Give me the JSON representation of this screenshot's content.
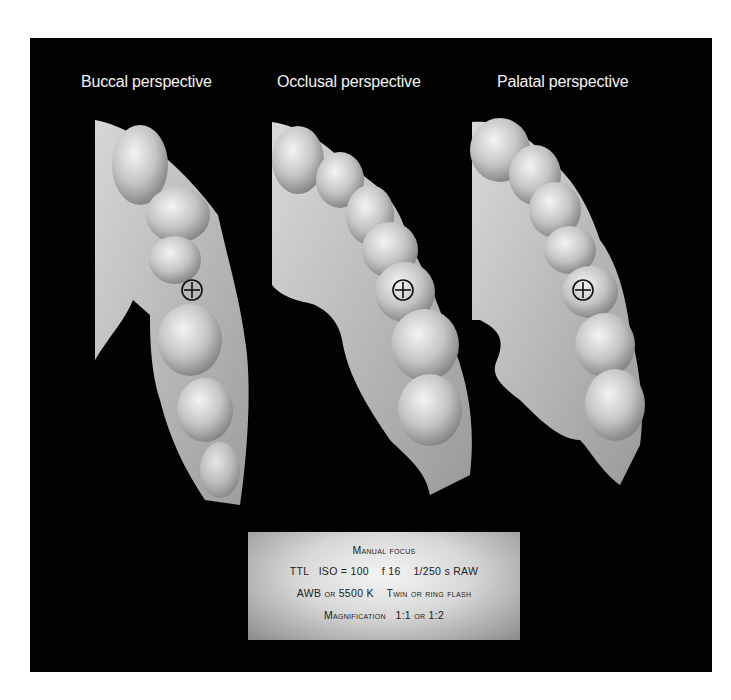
{
  "panel": {
    "background": "#020202"
  },
  "views": [
    {
      "id": "buccal",
      "caption": "Buccal perspective",
      "marker": {
        "cx": 192,
        "cy": 290,
        "r": 10
      }
    },
    {
      "id": "occlusal",
      "caption": "Occlusal perspective",
      "marker": {
        "cx": 403,
        "cy": 290,
        "r": 10
      }
    },
    {
      "id": "palatal",
      "caption": "Palatal perspective",
      "marker": {
        "cx": 583,
        "cy": 290,
        "r": 10
      }
    }
  ],
  "marker_icon": "crosshair-circle-icon",
  "settings": {
    "line1": "Manual focus",
    "line2": {
      "metering": "TTL",
      "iso": "ISO = 100",
      "aperture": "f 16",
      "shutter": "1/250 s",
      "format": "RAW"
    },
    "line3": {
      "white_balance": "AWB or 5500 K",
      "flash": "Twin or ring flash"
    },
    "line4": {
      "label": "Magnification",
      "value": "1:1 or 1:2"
    }
  }
}
